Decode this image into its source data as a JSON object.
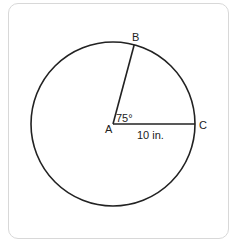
{
  "figure": {
    "type": "circle-sector-diagram",
    "center_label": "A",
    "point_labels": {
      "B": "B",
      "C": "C"
    },
    "angle_label": "75°",
    "radius_label": "10 in.",
    "angle_degrees": 75,
    "radius_value": 10,
    "radius_unit": "in.",
    "colors": {
      "stroke": "#222222",
      "card_border": "#d8d8d8",
      "background": "#ffffff"
    }
  }
}
